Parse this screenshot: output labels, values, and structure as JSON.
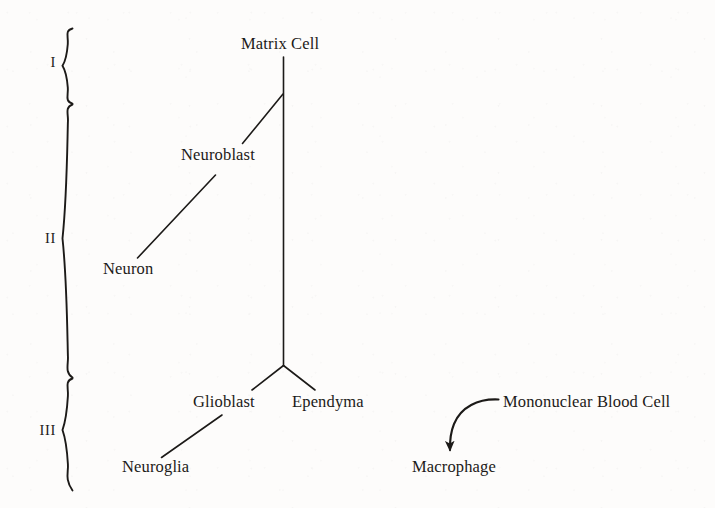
{
  "figure": {
    "type": "lineage-diagram",
    "background_color": "#fdfcfb",
    "ink_color": "#1c1a18",
    "width": 715,
    "height": 508
  },
  "stages": [
    {
      "id": "I",
      "label": "I",
      "brace_top": 28,
      "brace_bottom": 104
    },
    {
      "id": "II",
      "label": "II",
      "brace_top": 104,
      "brace_bottom": 378
    },
    {
      "id": "III",
      "label": "III",
      "brace_top": 378,
      "brace_bottom": 491
    }
  ],
  "nodes": [
    {
      "id": "matrix-cell",
      "label": "Matrix Cell",
      "x": 241,
      "y": 36,
      "stage": "I"
    },
    {
      "id": "neuroblast",
      "label": "Neuroblast",
      "x": 181,
      "y": 147,
      "stage": "II"
    },
    {
      "id": "neuron",
      "label": "Neuron",
      "x": 103,
      "y": 261,
      "stage": "II"
    },
    {
      "id": "glioblast",
      "label": "Glioblast",
      "x": 193,
      "y": 394,
      "stage": "III"
    },
    {
      "id": "ependyma",
      "label": "Ependyma",
      "x": 292,
      "y": 394,
      "stage": "III"
    },
    {
      "id": "neuroglia",
      "label": "Neuroglia",
      "x": 122,
      "y": 459,
      "stage": "III"
    },
    {
      "id": "mononuclear-blood-cell",
      "label": "Mononuclear Blood Cell",
      "x": 503,
      "y": 394,
      "stage": "none"
    },
    {
      "id": "macrophage",
      "label": "Macrophage",
      "x": 412,
      "y": 459,
      "stage": "none"
    }
  ],
  "edges": [
    {
      "id": "matrix-to-fork",
      "from": "matrix-cell",
      "to": "ependyma-fork",
      "kind": "straight"
    },
    {
      "id": "matrix-to-neuroblast",
      "from": "matrix-cell",
      "to": "neuroblast",
      "kind": "straight"
    },
    {
      "id": "neuroblast-to-neuron",
      "from": "neuroblast",
      "to": "neuron",
      "kind": "straight"
    },
    {
      "id": "fork-to-glioblast",
      "from": "ependyma-fork",
      "to": "glioblast",
      "kind": "straight"
    },
    {
      "id": "fork-to-ependyma",
      "from": "ependyma-fork",
      "to": "ependyma",
      "kind": "straight"
    },
    {
      "id": "glioblast-to-neuroglia",
      "from": "glioblast",
      "to": "neuroglia",
      "kind": "straight"
    },
    {
      "id": "blood-cell-to-macrophage",
      "from": "mononuclear-blood-cell",
      "to": "macrophage",
      "kind": "curved-arrow"
    }
  ]
}
